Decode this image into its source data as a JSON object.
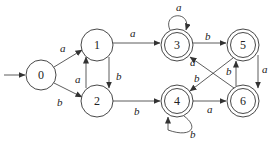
{
  "diagram": {
    "type": "finite-automaton",
    "start_state": "0",
    "states": [
      {
        "id": "0",
        "label": "0",
        "x": 41,
        "y": 75,
        "accepting": false
      },
      {
        "id": "1",
        "label": "1",
        "x": 97,
        "y": 45,
        "accepting": false
      },
      {
        "id": "2",
        "label": "2",
        "x": 97,
        "y": 101,
        "accepting": false
      },
      {
        "id": "3",
        "label": "3",
        "x": 177,
        "y": 45,
        "accepting": true
      },
      {
        "id": "4",
        "label": "4",
        "x": 177,
        "y": 101,
        "accepting": true
      },
      {
        "id": "5",
        "label": "5",
        "x": 243,
        "y": 45,
        "accepting": true
      },
      {
        "id": "6",
        "label": "6",
        "x": 243,
        "y": 101,
        "accepting": true
      }
    ],
    "transitions": [
      {
        "from": "0",
        "to": "1",
        "label": "a"
      },
      {
        "from": "0",
        "to": "2",
        "label": "b"
      },
      {
        "from": "1",
        "to": "3",
        "label": "a"
      },
      {
        "from": "1",
        "to": "2",
        "label": "b"
      },
      {
        "from": "2",
        "to": "1",
        "label": "a"
      },
      {
        "from": "2",
        "to": "4",
        "label": "b"
      },
      {
        "from": "3",
        "to": "3",
        "label": "a"
      },
      {
        "from": "3",
        "to": "5",
        "label": "b"
      },
      {
        "from": "4",
        "to": "4",
        "label": "b"
      },
      {
        "from": "4",
        "to": "6",
        "label": "a"
      },
      {
        "from": "5",
        "to": "6",
        "label": "a"
      },
      {
        "from": "5",
        "to": "4",
        "label": "b"
      },
      {
        "from": "6",
        "to": "3",
        "label": "a"
      },
      {
        "from": "6",
        "to": "5",
        "label": "b"
      }
    ]
  },
  "labels": {
    "s0": "0",
    "s1": "1",
    "s2": "2",
    "s3": "3",
    "s4": "4",
    "s5": "5",
    "s6": "6",
    "e01": "a",
    "e02": "b",
    "e13": "a",
    "e12": "b",
    "e21": "a",
    "e24": "b",
    "e33": "a",
    "e35": "b",
    "e44": "b",
    "e46": "a",
    "e56": "a",
    "e54": "b",
    "e63": "a",
    "e65": "b"
  }
}
